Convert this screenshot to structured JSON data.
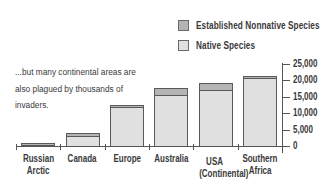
{
  "chart_data": {
    "type": "bar",
    "stacked": true,
    "title": "",
    "annotation": "...but many continental areas are also plagued by thousands of invaders.",
    "categories": [
      "Russian Arctic",
      "Canada",
      "Europe",
      "Australia",
      "USA (Continental)",
      "Southern Africa"
    ],
    "category_lines": [
      [
        "Russian",
        "Arctic"
      ],
      [
        "Canada"
      ],
      [
        "Europe"
      ],
      [
        "Australia"
      ],
      [
        "USA",
        "(Continental)"
      ],
      [
        "Southern",
        "Africa"
      ]
    ],
    "series": [
      {
        "name": "Native Species",
        "color": "#e0e0e0",
        "values": [
          800,
          3100,
          11800,
          15600,
          17000,
          20700
        ]
      },
      {
        "name": "Established Nonnative Species",
        "color": "#b4b4b4",
        "values": [
          250,
          1000,
          700,
          2100,
          2200,
          600
        ]
      }
    ],
    "totals": [
      1050,
      4100,
      12500,
      17700,
      19200,
      21300
    ],
    "xlabel": "",
    "ylabel": "",
    "ylim": [
      0,
      25000
    ],
    "yticks": [
      0,
      5000,
      10000,
      15000,
      20000,
      25000
    ],
    "ytick_labels": [
      "0",
      "5,000",
      "10,000",
      "15,000",
      "20,000",
      "25,000"
    ],
    "y_axis_position": "right",
    "grid": false,
    "legend_position": "top-right"
  },
  "legend": {
    "items": [
      {
        "label": "Established Nonnative Species",
        "color": "#b4b4b4"
      },
      {
        "label": "Native Species",
        "color": "#e0e0e0"
      }
    ]
  },
  "annotation": {
    "line1": "...but many continental areas are",
    "line2": "also plagued by thousands of",
    "line3": "invaders."
  }
}
